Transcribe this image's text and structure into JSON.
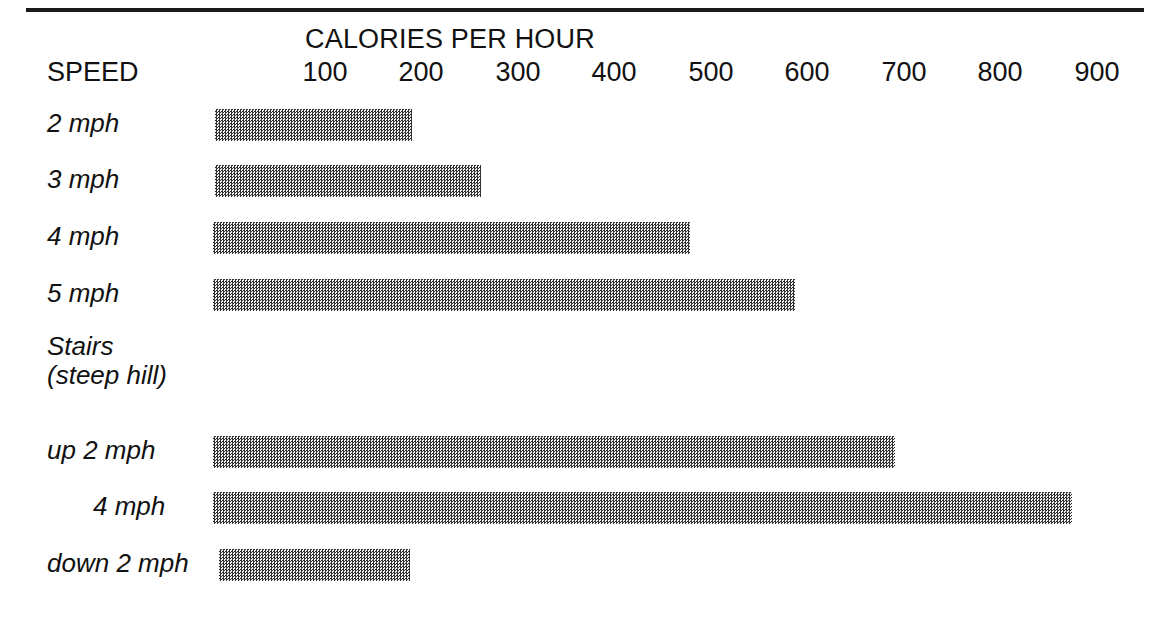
{
  "chart_data": {
    "type": "bar",
    "title": "CALORIES PER HOUR",
    "xlabel": "CALORIES PER HOUR",
    "ylabel": "SPEED",
    "orientation": "horizontal",
    "grid": false,
    "legend": false,
    "xlim": [
      0,
      950
    ],
    "tick_labels": [
      "100",
      "200",
      "300",
      "400",
      "500",
      "600",
      "700",
      "800",
      "900"
    ],
    "tick_values": [
      100,
      200,
      300,
      400,
      500,
      600,
      700,
      800,
      900
    ],
    "categories": [
      "2 mph",
      "3 mph",
      "4 mph",
      "5 mph",
      "Stairs (steep hill)",
      "up 2 mph",
      "4 mph",
      "down 2 mph"
    ],
    "values": [
      190,
      260,
      478,
      587,
      null,
      690,
      875,
      188
    ],
    "series": [
      {
        "name": "Calories per hour",
        "points": [
          {
            "label": "2 mph",
            "value": 190
          },
          {
            "label": "3 mph",
            "value": 260
          },
          {
            "label": "4 mph",
            "value": 478
          },
          {
            "label": "5 mph",
            "value": 587
          },
          {
            "label": "Stairs (steep hill)",
            "value": null
          },
          {
            "label": "up 2 mph",
            "value": 690
          },
          {
            "label": "4 mph",
            "value": 875
          },
          {
            "label": "down 2 mph",
            "value": 188
          }
        ]
      }
    ],
    "colors": {
      "bar_fill": "#9a9a9a",
      "bar_pattern": "#2b2b2b",
      "text": "#111111",
      "rule": "#1a1a1a"
    }
  },
  "header": {
    "axis_title": "CALORIES PER HOUR",
    "speed_label": "SPEED"
  },
  "axis": {
    "ticks": [
      {
        "label": "100",
        "x": 325
      },
      {
        "label": "200",
        "x": 421
      },
      {
        "label": "300",
        "x": 518
      },
      {
        "label": "400",
        "x": 614
      },
      {
        "label": "500",
        "x": 711
      },
      {
        "label": "600",
        "x": 807
      },
      {
        "label": "700",
        "x": 904
      },
      {
        "label": "800",
        "x": 1000
      },
      {
        "label": "900",
        "x": 1097
      }
    ]
  },
  "rows": [
    {
      "label": "2 mph",
      "label2": "",
      "indent": false,
      "top": 108,
      "bar": {
        "left": 215,
        "width": 197
      }
    },
    {
      "label": "3 mph",
      "label2": "",
      "indent": false,
      "top": 164,
      "bar": {
        "left": 215,
        "width": 266
      }
    },
    {
      "label": "4 mph",
      "label2": "",
      "indent": false,
      "top": 221,
      "bar": {
        "left": 213,
        "width": 477
      }
    },
    {
      "label": "5 mph",
      "label2": "",
      "indent": false,
      "top": 278,
      "bar": {
        "left": 213,
        "width": 582
      }
    },
    {
      "label": "Stairs",
      "label2": "(steep hill)",
      "indent": false,
      "top": 336,
      "bar": null
    },
    {
      "label": "up 2 mph",
      "label2": "",
      "indent": false,
      "top": 435,
      "bar": {
        "left": 213,
        "width": 682
      }
    },
    {
      "label": "4 mph",
      "label2": "",
      "indent": true,
      "top": 491,
      "bar": {
        "left": 213,
        "width": 859
      }
    },
    {
      "label": "down 2 mph",
      "label2": "",
      "indent": false,
      "top": 548,
      "bar": {
        "left": 219,
        "width": 191
      }
    }
  ]
}
